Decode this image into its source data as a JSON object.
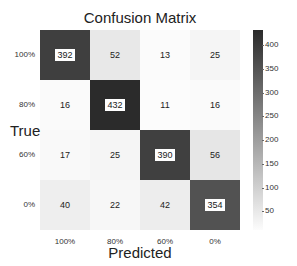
{
  "chart_data": {
    "type": "heatmap",
    "title": "Confusion Matrix",
    "xlabel": "Predicted",
    "ylabel": "True",
    "x_tick_labels": [
      "100%",
      "80%",
      "60%",
      "0%"
    ],
    "y_tick_labels": [
      "100%",
      "80%",
      "60%",
      "0%"
    ],
    "matrix": [
      [
        392,
        52,
        13,
        25
      ],
      [
        16,
        432,
        11,
        16
      ],
      [
        17,
        25,
        390,
        56
      ],
      [
        40,
        22,
        42,
        354
      ]
    ],
    "colorbar": {
      "ticks": [
        400,
        350,
        300,
        250,
        200,
        150,
        100,
        50
      ],
      "range": [
        11,
        432
      ],
      "colormap": "Greys"
    },
    "grid": false
  },
  "colors": {
    "low": "#ffffff",
    "high": "#2b2b2b"
  }
}
